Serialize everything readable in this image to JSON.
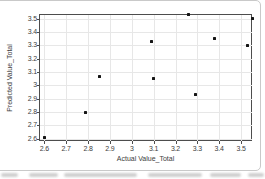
{
  "chart_data": {
    "type": "scatter",
    "title": "",
    "xlabel": "Actual Value_Total",
    "ylabel": "Predicted Value_Total",
    "x_ticks": {
      "values": [
        2.6,
        2.7,
        2.8,
        2.9,
        3.0,
        3.1,
        3.2,
        3.3,
        3.4,
        3.5
      ],
      "labels": [
        "2.6",
        "2.7",
        "2.8",
        "2.9",
        "3",
        "3.1",
        "3.2",
        "3.3",
        "3.4",
        "3.5"
      ]
    },
    "y_ticks": {
      "values": [
        2.6,
        2.7,
        2.8,
        2.9,
        3.0,
        3.1,
        3.2,
        3.3,
        3.4,
        3.5
      ],
      "labels": [
        "2.6",
        "2.7",
        "2.8",
        "2.9",
        "3",
        "3.1",
        "3.2",
        "3.3",
        "3.4",
        "3.5"
      ]
    },
    "xlim": [
      2.58,
      3.55
    ],
    "ylim": [
      2.582,
      3.528
    ],
    "grid": true,
    "legend": false,
    "points": [
      {
        "x": 2.6,
        "y": 2.61
      },
      {
        "x": 2.79,
        "y": 2.8
      },
      {
        "x": 2.85,
        "y": 3.07
      },
      {
        "x": 3.09,
        "y": 3.33
      },
      {
        "x": 3.1,
        "y": 3.05
      },
      {
        "x": 3.26,
        "y": 3.53
      },
      {
        "x": 3.29,
        "y": 2.93
      },
      {
        "x": 3.38,
        "y": 3.35
      },
      {
        "x": 3.53,
        "y": 3.3
      },
      {
        "x": 3.55,
        "y": 3.5
      }
    ]
  },
  "colors": {
    "point": "#161616",
    "grid": "#e7e7e7",
    "plot_border": "#4d4d4d",
    "panel_border": "#c9c9c9",
    "tick_text": "#3d3d3d"
  }
}
